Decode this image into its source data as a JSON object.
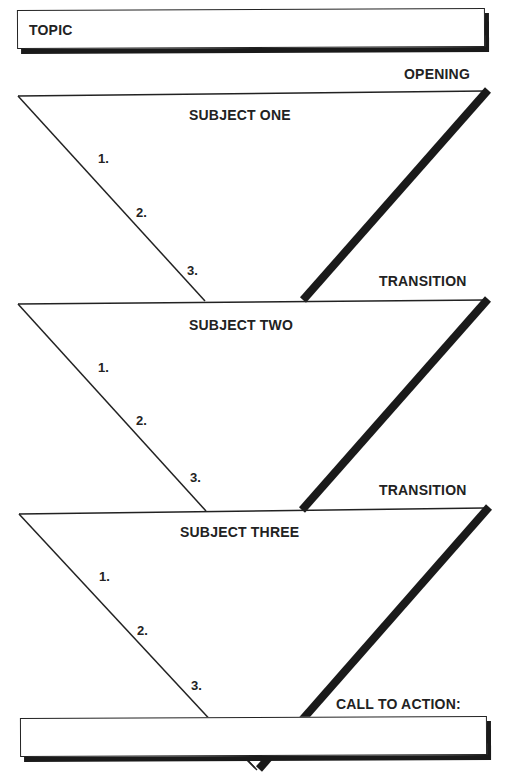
{
  "topic_box": {
    "label": "TOPIC"
  },
  "labels": {
    "opening": "OPENING",
    "transition_1": "TRANSITION",
    "transition_2": "TRANSITION",
    "call_to_action": "CALL TO ACTION:"
  },
  "subjects": [
    {
      "title": "SUBJECT ONE",
      "points": [
        "1.",
        "2.",
        "3."
      ]
    },
    {
      "title": "SUBJECT TWO",
      "points": [
        "1.",
        "2.",
        "3."
      ]
    },
    {
      "title": "SUBJECT THREE",
      "points": [
        "1.",
        "2.",
        "3."
      ]
    }
  ],
  "colors": {
    "line": "#222222",
    "shadow": "#1a1a1a",
    "background": "#ffffff"
  }
}
